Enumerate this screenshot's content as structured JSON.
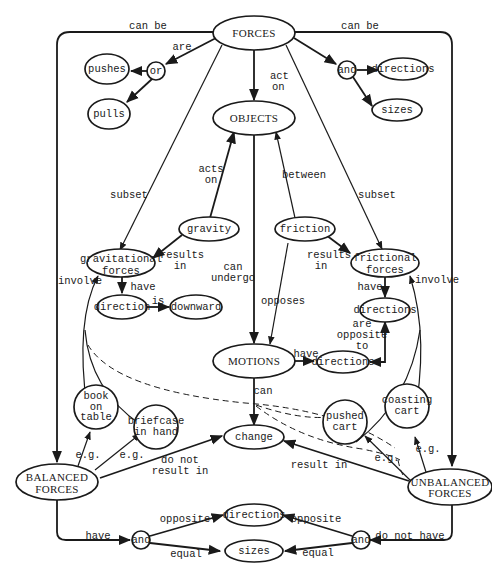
{
  "colors": {
    "ink": "#1a1a1a",
    "paper": "#ffffff"
  },
  "nodes": {
    "forces": "FORCES",
    "pushes": "pushes",
    "or": "or",
    "pulls": "pulls",
    "and_top": "and",
    "directions_top": "directions",
    "sizes_top": "sizes",
    "objects": "OBJECTS",
    "gravity": "gravity",
    "friction": "friction",
    "grav_forces_1": "gravitational",
    "grav_forces_2": "forces",
    "fric_forces_1": "frictional",
    "fric_forces_2": "forces",
    "direction": "direction",
    "downward": "downward",
    "directions_right": "directions",
    "motions": "MOTIONS",
    "directions_mid": "directions",
    "book_1": "book",
    "book_2": "on",
    "book_3": "table",
    "briefcase_1": "briefcase",
    "briefcase_2": "in hand",
    "pushed_1": "pushed",
    "pushed_2": "cart",
    "coasting_1": "coasting",
    "coasting_2": "cart",
    "change": "change",
    "balanced_1": "BALANCED",
    "balanced_2": "FORCES",
    "unbalanced_1": "UNBALANCED",
    "unbalanced_2": "FORCES",
    "directions_bottom": "directions",
    "sizes_bottom": "sizes",
    "and_left": "and",
    "and_right": "and"
  },
  "links": {
    "can_be_left": "can be",
    "can_be_right": "can be",
    "are": "are",
    "act": "act",
    "on": "on",
    "acts": "acts",
    "acts_on": "on",
    "between": "between",
    "subset_left": "subset",
    "subset_right": "subset",
    "results_left": "results",
    "in_left": "in",
    "results_right": "results",
    "in_right": "in",
    "can": "can",
    "undergo": "undergo",
    "opposes": "opposes",
    "involve_left": "involve",
    "involve_right": "involve",
    "have_grav": "have",
    "have_fric": "have",
    "is": "is",
    "are_opp_1": "are",
    "are_opp_2": "opposite",
    "are_opp_3": "to",
    "have_motions": "have",
    "can_change": "can",
    "eg_book": "e.g.",
    "eg_briefcase": "e.g.",
    "eg_pushed": "e.g.",
    "eg_coasting": "e.g.",
    "do_not_1": "do not",
    "do_not_2": "result in",
    "result_in": "result in",
    "have_balanced": "have",
    "do_not_have": "do not have",
    "opposite_left": "opposite",
    "equal_left": "equal",
    "opposite_right": "opposite",
    "equal_right": "equal"
  }
}
